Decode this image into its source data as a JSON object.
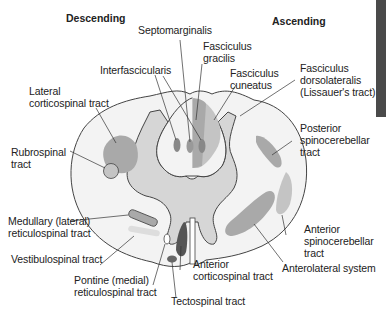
{
  "headers": {
    "descending": "Descending",
    "ascending": "Ascending"
  },
  "labels": {
    "septomarginalis": "Septomarginalis",
    "fasciculus_gracilis": "Fasciculus\ngracilis",
    "interfascicularis": "Interfascicularis",
    "fasciculus_cuneatus": "Fasciculus\ncuneatus",
    "lateral_corticospinal": "Lateral\ncorticospinal tract",
    "fasciculus_dorsolateralis": "Fasciculus\ndorsolateralis\n(Lissauer's tract)",
    "rubrospinal": "Rubrospinal\ntract",
    "posterior_spinocerebellar": "Posterior\nspinocerebellar\ntract",
    "medullary_reticulospinal": "Medullary (lateral)\nreticulospinal tract",
    "vestibulospinal": "Vestibulospinal tract",
    "anterior_spinocerebellar": "Anterior\nspinocerebellar\ntract",
    "anterior_corticospinal": "Anterior\ncorticospinal tract",
    "anterolateral_system": "Anterolateral system",
    "pontine_reticulospinal": "Pontine (medial)\nreticulospinal tract",
    "tectospinal": "Tectospinal tract"
  },
  "colors": {
    "white_matter": "#f3f3f3",
    "gray_matter": "#d6d6d6",
    "tract_medium": "#a9a9a9",
    "tract_light": "#c4c4c4",
    "tract_dark": "#555555",
    "outline": "#444444",
    "edge_bar": "#4a4a4a"
  }
}
